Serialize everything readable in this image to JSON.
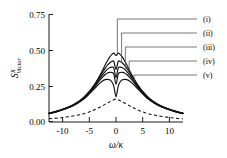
{
  "chart_data": {
    "type": "line",
    "title": "",
    "xlabel": "ω/κ",
    "ylabel": "S^X_Victor",
    "ylabel_base": "S",
    "ylabel_sup": "X",
    "ylabel_sub": "Victor",
    "xlim": [
      -12.5,
      12.5
    ],
    "ylim": [
      0.0,
      0.75
    ],
    "xticks": [
      -10,
      -5,
      0,
      5,
      10
    ],
    "xtick_labels": [
      "-10",
      "-5",
      "0",
      "5",
      "10"
    ],
    "yticks": [
      0.0,
      0.25,
      0.5,
      0.75
    ],
    "ytick_labels": [
      "0.00",
      "0.25",
      "0.50",
      "0.75"
    ],
    "grid": false,
    "legend_position": "right-outside",
    "legend_style": "leader-lines",
    "x": [
      -12.5,
      -11.5,
      -10.5,
      -10,
      -9,
      -8,
      -7,
      -6,
      -5,
      -4.5,
      -4,
      -3.5,
      -3,
      -2.5,
      -2,
      -1.6,
      -1.2,
      -0.8,
      -0.4,
      0,
      0.4,
      0.8,
      1.2,
      1.6,
      2,
      2.5,
      3,
      3.5,
      4,
      4.5,
      5,
      6,
      7,
      8,
      9,
      10,
      10.5,
      11.5,
      12.5
    ],
    "series": [
      {
        "name": "(i)",
        "label": "(i)",
        "style": "solid",
        "color": "#111111",
        "peak": 0.485,
        "center_dip": 0.455,
        "values": [
          0.062,
          0.071,
          0.082,
          0.088,
          0.102,
          0.12,
          0.142,
          0.172,
          0.212,
          0.236,
          0.262,
          0.292,
          0.325,
          0.36,
          0.397,
          0.425,
          0.45,
          0.468,
          0.478,
          0.462,
          0.478,
          0.468,
          0.45,
          0.425,
          0.397,
          0.36,
          0.325,
          0.292,
          0.262,
          0.236,
          0.212,
          0.172,
          0.142,
          0.12,
          0.102,
          0.088,
          0.082,
          0.071,
          0.062
        ]
      },
      {
        "name": "(ii)",
        "label": "(ii)",
        "style": "solid",
        "color": "#111111",
        "peak": 0.425,
        "center_dip": 0.352,
        "values": [
          0.061,
          0.07,
          0.081,
          0.087,
          0.101,
          0.118,
          0.14,
          0.169,
          0.208,
          0.231,
          0.256,
          0.284,
          0.314,
          0.345,
          0.374,
          0.394,
          0.41,
          0.42,
          0.42,
          0.366,
          0.42,
          0.42,
          0.41,
          0.394,
          0.374,
          0.345,
          0.314,
          0.284,
          0.256,
          0.231,
          0.208,
          0.169,
          0.14,
          0.118,
          0.101,
          0.087,
          0.081,
          0.07,
          0.061
        ]
      },
      {
        "name": "(iii)",
        "label": "(iii)",
        "style": "solid",
        "color": "#111111",
        "peak": 0.382,
        "center_dip": 0.296,
        "values": [
          0.06,
          0.069,
          0.08,
          0.086,
          0.1,
          0.117,
          0.138,
          0.166,
          0.204,
          0.226,
          0.249,
          0.275,
          0.302,
          0.329,
          0.352,
          0.367,
          0.377,
          0.381,
          0.374,
          0.308,
          0.374,
          0.381,
          0.377,
          0.367,
          0.352,
          0.329,
          0.302,
          0.275,
          0.249,
          0.226,
          0.204,
          0.166,
          0.138,
          0.117,
          0.1,
          0.086,
          0.08,
          0.069,
          0.06
        ]
      },
      {
        "name": "(iv)",
        "label": "(iv)",
        "style": "solid",
        "color": "#111111",
        "peak": 0.345,
        "center_dip": 0.252,
        "values": [
          0.059,
          0.068,
          0.079,
          0.085,
          0.099,
          0.115,
          0.136,
          0.163,
          0.2,
          0.221,
          0.243,
          0.266,
          0.29,
          0.312,
          0.33,
          0.34,
          0.345,
          0.344,
          0.332,
          0.262,
          0.332,
          0.344,
          0.345,
          0.34,
          0.33,
          0.312,
          0.29,
          0.266,
          0.243,
          0.221,
          0.2,
          0.163,
          0.136,
          0.115,
          0.099,
          0.085,
          0.079,
          0.068,
          0.059
        ]
      },
      {
        "name": "(v)",
        "label": "(v)",
        "style": "solid",
        "color": "#111111",
        "peak": 0.296,
        "center_dip": 0.168,
        "values": [
          0.058,
          0.067,
          0.078,
          0.084,
          0.097,
          0.113,
          0.133,
          0.159,
          0.194,
          0.213,
          0.232,
          0.252,
          0.27,
          0.285,
          0.294,
          0.296,
          0.293,
          0.28,
          0.248,
          0.175,
          0.248,
          0.28,
          0.293,
          0.296,
          0.294,
          0.285,
          0.27,
          0.252,
          0.232,
          0.213,
          0.194,
          0.159,
          0.133,
          0.113,
          0.097,
          0.084,
          0.078,
          0.067,
          0.058
        ]
      },
      {
        "name": "reference",
        "label": "",
        "style": "dashed",
        "color": "#111111",
        "peak": 0.162,
        "center_dip": 0.162,
        "values": [
          0.022,
          0.025,
          0.029,
          0.031,
          0.036,
          0.042,
          0.049,
          0.058,
          0.07,
          0.077,
          0.085,
          0.094,
          0.103,
          0.113,
          0.124,
          0.132,
          0.14,
          0.148,
          0.155,
          0.159,
          0.155,
          0.148,
          0.14,
          0.132,
          0.124,
          0.113,
          0.103,
          0.094,
          0.085,
          0.077,
          0.07,
          0.058,
          0.049,
          0.042,
          0.036,
          0.031,
          0.029,
          0.025,
          0.022
        ]
      }
    ],
    "legend_entries": [
      {
        "label": "(i)",
        "anchor_x": 0.25,
        "anchor_y": 0.462,
        "label_y": 19
      },
      {
        "label": "(ii)",
        "anchor_x": 1.05,
        "anchor_y": 0.412,
        "label_y": 33
      },
      {
        "label": "(iii)",
        "anchor_x": 1.75,
        "anchor_y": 0.37,
        "label_y": 47
      },
      {
        "label": "(iv)",
        "anchor_x": 2.45,
        "anchor_y": 0.33,
        "label_y": 61
      },
      {
        "label": "(v)",
        "anchor_x": 3.35,
        "anchor_y": 0.268,
        "label_y": 75
      }
    ]
  },
  "figure": {
    "background": "#ffffff",
    "axis_color": "#1a1a1a",
    "curve_color": "#111111",
    "leader_color": "#4a4a4a"
  }
}
